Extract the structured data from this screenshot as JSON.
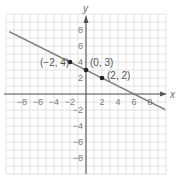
{
  "chart_data": {
    "type": "line",
    "title": "",
    "xlabel": "x",
    "ylabel": "y",
    "xlim": [
      -10,
      10
    ],
    "ylim": [
      -10,
      10
    ],
    "grid": true,
    "x_ticks": [
      -8,
      -6,
      -4,
      -2,
      2,
      4,
      6,
      8
    ],
    "y_ticks": [
      8,
      6,
      4,
      2,
      -2,
      -4,
      -6,
      -8
    ],
    "x_tick_labels": [
      "−8",
      "−6",
      "−4",
      "−2",
      "2",
      "4",
      "6",
      "8"
    ],
    "y_tick_labels": [
      "8",
      "6",
      "4",
      "2",
      "−2",
      "−4",
      "−6",
      "−8"
    ],
    "series": [
      {
        "name": "line",
        "equation": "y = -x/2 + 3",
        "x": [
          -9.6,
          9.9
        ],
        "y": [
          7.8,
          -1.95
        ]
      }
    ],
    "points": [
      {
        "x": -2,
        "y": 4,
        "label": "(−2, 4)"
      },
      {
        "x": 0,
        "y": 3,
        "label": "(0, 3)"
      },
      {
        "x": 2,
        "y": 2,
        "label": "(2, 2)"
      }
    ]
  },
  "colors": {
    "grid": "#d9d9d9",
    "axis": "#555555",
    "line": "#7a7a7a",
    "point": "#222222"
  }
}
